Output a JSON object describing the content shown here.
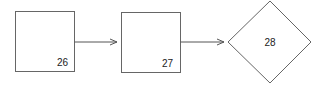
{
  "diagram": {
    "nodes": [
      {
        "id": "n26",
        "shape": "rectangle",
        "label": "26"
      },
      {
        "id": "n27",
        "shape": "rectangle",
        "label": "27"
      },
      {
        "id": "n28",
        "shape": "diamond",
        "label": "28"
      }
    ],
    "edges": [
      {
        "from": "n26",
        "to": "n27"
      },
      {
        "from": "n27",
        "to": "n28"
      }
    ],
    "colors": {
      "stroke": "#555555",
      "text": "#222222",
      "background": "#ffffff"
    }
  }
}
